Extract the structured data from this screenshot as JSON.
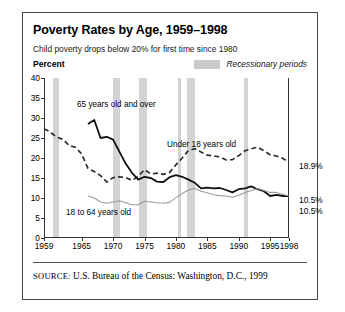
{
  "exhibit_label": "",
  "figure": {
    "title": "Poverty Rates by Age, 1959–1998",
    "subtitle": "Child poverty drops below 20% for first time since 1980",
    "source_keyword": "SOURCE:",
    "source_text": " U.S. Bureau of the Census: Washington, D.C., 1999"
  },
  "legend": {
    "swatch_name": "recession-band-swatch",
    "label": "Recessionary periods",
    "swatch_color": "#c9c9c9"
  },
  "chart_data": {
    "type": "line",
    "title": "Poverty Rates by Age, 1959–1998",
    "subtitle": "Child poverty drops below 20% for first time since 1980",
    "xlabel": "",
    "ylabel": "Percent",
    "ylim": [
      0,
      40
    ],
    "xlim": [
      1959,
      1998
    ],
    "ytick_labels": [
      "40",
      "35",
      "30",
      "25",
      "20",
      "15",
      "10",
      "5",
      "0"
    ],
    "ytick_values": [
      40,
      35,
      30,
      25,
      20,
      15,
      10,
      5,
      0
    ],
    "xtick_labels": [
      "1959",
      "1965",
      "1970",
      "1975",
      "1980",
      "1985",
      "1990",
      "1995",
      "1998"
    ],
    "xtick_values": [
      1959,
      1965,
      1970,
      1975,
      1980,
      1985,
      1990,
      1995,
      1998
    ],
    "grid": false,
    "legend_position": "top-right",
    "colors": {
      "under18": "#2b2b2b",
      "over65": "#111111",
      "age18to64": "#9a9a9a",
      "band": "#d3d3d3",
      "axis": "#333333"
    },
    "series": [
      {
        "name": "Under 18 years old",
        "style": "dashed",
        "color": "#2b2b2b",
        "x": [
          1959,
          1960,
          1961,
          1962,
          1963,
          1964,
          1965,
          1966,
          1967,
          1968,
          1969,
          1970,
          1971,
          1972,
          1973,
          1974,
          1975,
          1976,
          1977,
          1978,
          1979,
          1980,
          1981,
          1982,
          1983,
          1984,
          1985,
          1986,
          1987,
          1988,
          1989,
          1990,
          1991,
          1992,
          1993,
          1994,
          1995,
          1996,
          1997,
          1998
        ],
        "values": [
          27.3,
          26.5,
          25.2,
          24.7,
          23.1,
          22.7,
          21.0,
          17.4,
          16.6,
          15.6,
          14.0,
          15.1,
          15.3,
          15.1,
          14.4,
          15.4,
          17.1,
          16.0,
          16.2,
          15.9,
          16.4,
          18.3,
          20.0,
          21.9,
          22.3,
          21.5,
          20.7,
          20.5,
          20.3,
          19.5,
          19.6,
          20.6,
          21.8,
          22.3,
          22.7,
          21.8,
          20.8,
          20.5,
          19.9,
          18.9
        ]
      },
      {
        "name": "65 years old and over",
        "style": "solid",
        "color": "#111111",
        "x": [
          1966,
          1967,
          1968,
          1969,
          1970,
          1971,
          1972,
          1973,
          1974,
          1975,
          1976,
          1977,
          1978,
          1979,
          1980,
          1981,
          1982,
          1983,
          1984,
          1985,
          1986,
          1987,
          1988,
          1989,
          1990,
          1991,
          1992,
          1993,
          1994,
          1995,
          1996,
          1997,
          1998
        ],
        "values": [
          28.5,
          29.5,
          25.0,
          25.3,
          24.6,
          21.6,
          18.6,
          16.3,
          14.6,
          15.3,
          15.0,
          14.1,
          14.0,
          15.2,
          15.7,
          15.3,
          14.6,
          13.8,
          12.4,
          12.6,
          12.4,
          12.5,
          12.0,
          11.4,
          12.2,
          12.4,
          12.9,
          12.2,
          11.7,
          10.5,
          10.8,
          10.5,
          10.5
        ]
      },
      {
        "name": "18 to 64 years old",
        "style": "solid-thin",
        "color": "#9a9a9a",
        "x": [
          1966,
          1967,
          1968,
          1969,
          1970,
          1971,
          1972,
          1973,
          1974,
          1975,
          1976,
          1977,
          1978,
          1979,
          1980,
          1981,
          1982,
          1983,
          1984,
          1985,
          1986,
          1987,
          1988,
          1989,
          1990,
          1991,
          1992,
          1993,
          1994,
          1995,
          1996,
          1997,
          1998
        ],
        "values": [
          10.5,
          10.0,
          9.0,
          8.7,
          9.0,
          9.3,
          8.8,
          8.3,
          8.3,
          9.2,
          9.0,
          8.8,
          8.7,
          8.9,
          10.1,
          11.1,
          12.0,
          12.4,
          11.7,
          11.3,
          10.8,
          10.6,
          10.5,
          10.2,
          10.7,
          11.4,
          11.9,
          12.4,
          11.9,
          11.4,
          11.4,
          10.9,
          10.5
        ]
      }
    ],
    "recession_bands": [
      {
        "start": 1960.3,
        "end": 1961.2
      },
      {
        "start": 1969.9,
        "end": 1970.9
      },
      {
        "start": 1973.9,
        "end": 1975.2
      },
      {
        "start": 1980.1,
        "end": 1980.6
      },
      {
        "start": 1981.6,
        "end": 1982.9
      },
      {
        "start": 1990.6,
        "end": 1991.3
      }
    ],
    "series_annotations": [
      {
        "name": "over65-label",
        "text": "65 years old and over",
        "x_px": 33,
        "y_px": 22
      },
      {
        "name": "under18-label",
        "text": "Under 18 years old",
        "x_px": 123,
        "y_px": 62
      },
      {
        "name": "age18to64-label",
        "text": "18 to 64 years old",
        "x_px": 22,
        "y_px": 130
      }
    ],
    "end_values": [
      {
        "name": "under18-end-value",
        "text": "18.9%",
        "y_px": 83
      },
      {
        "name": "over65-end-value",
        "text": "10.5%",
        "y_px": 117
      },
      {
        "name": "age18to64-end-value",
        "text": "10.5%",
        "y_px": 128
      }
    ]
  }
}
